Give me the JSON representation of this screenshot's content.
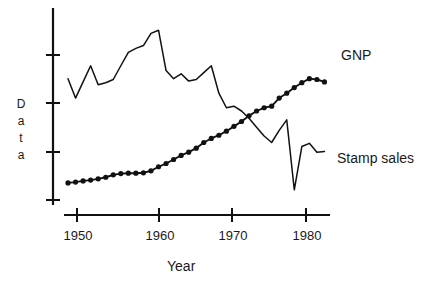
{
  "chart_data": {
    "type": "line",
    "title": "",
    "subtitle": "",
    "xlabel": "Year",
    "ylabel": "Data",
    "ylabel_letters": [
      "D",
      "a",
      "t",
      "a"
    ],
    "grid": false,
    "legend_position": "right-inline",
    "xlim": [
      1949,
      1984
    ],
    "ylim": [
      0,
      5
    ],
    "x_ticks": [
      1950,
      1960,
      1970,
      1980
    ],
    "x_tick_labels": [
      "1950",
      "1960",
      "1970",
      "1980"
    ],
    "y_ticks": [
      1,
      2,
      3,
      4
    ],
    "y_tick_labels": [
      "",
      "",
      "",
      ""
    ],
    "axis_color": "#111111",
    "series": [
      {
        "name": "GNP",
        "style": "line-with-round-markers",
        "color": "#111111",
        "markers": true,
        "label_position": "right-end",
        "x": [
          1949,
          1950,
          1951,
          1952,
          1953,
          1954,
          1955,
          1956,
          1957,
          1958,
          1959,
          1960,
          1961,
          1962,
          1963,
          1964,
          1965,
          1966,
          1967,
          1968,
          1969,
          1970,
          1971,
          1972,
          1973,
          1974,
          1975,
          1976,
          1977,
          1978,
          1979,
          1980,
          1981,
          1982,
          1983
        ],
        "y": [
          0.72,
          0.74,
          0.77,
          0.79,
          0.82,
          0.86,
          0.92,
          0.95,
          0.96,
          0.96,
          0.97,
          1.02,
          1.12,
          1.2,
          1.3,
          1.4,
          1.48,
          1.58,
          1.72,
          1.82,
          1.9,
          2.0,
          2.12,
          2.24,
          2.38,
          2.5,
          2.58,
          2.62,
          2.82,
          2.94,
          3.08,
          3.2,
          3.3,
          3.28,
          3.22
        ]
      },
      {
        "name": "Stamp sales",
        "style": "thin-line",
        "color": "#111111",
        "markers": false,
        "label_position": "right-end",
        "x": [
          1949,
          1950,
          1951,
          1952,
          1953,
          1954,
          1955,
          1956,
          1957,
          1958,
          1959,
          1960,
          1961,
          1962,
          1963,
          1964,
          1965,
          1966,
          1967,
          1968,
          1969,
          1970,
          1971,
          1972,
          1973,
          1974,
          1975,
          1976,
          1977,
          1978,
          1979,
          1980,
          1981,
          1982,
          1983
        ],
        "y": [
          3.3,
          2.82,
          3.22,
          3.62,
          3.15,
          3.2,
          3.28,
          3.62,
          3.95,
          4.05,
          4.12,
          4.42,
          4.5,
          3.5,
          3.3,
          3.42,
          3.24,
          3.28,
          3.45,
          3.62,
          2.94,
          2.58,
          2.62,
          2.5,
          2.32,
          2.1,
          1.88,
          1.72,
          2.02,
          2.28,
          0.55,
          1.62,
          1.7,
          1.48,
          1.5
        ]
      }
    ],
    "annotations": [
      {
        "text": "GNP",
        "target_series": "GNP"
      },
      {
        "text": "Stamp sales",
        "target_series": "Stamp sales"
      }
    ]
  },
  "axis": {
    "x_title": "Year",
    "y_title": "Data"
  },
  "labels": {
    "gnp": "GNP",
    "stamp_sales": "Stamp sales",
    "year": "Year",
    "y_letters": {
      "l0": "D",
      "l1": "a",
      "l2": "t",
      "l3": "a"
    },
    "x_ticks": {
      "t0": "1950",
      "t1": "1960",
      "t2": "1970",
      "t3": "1980"
    }
  }
}
